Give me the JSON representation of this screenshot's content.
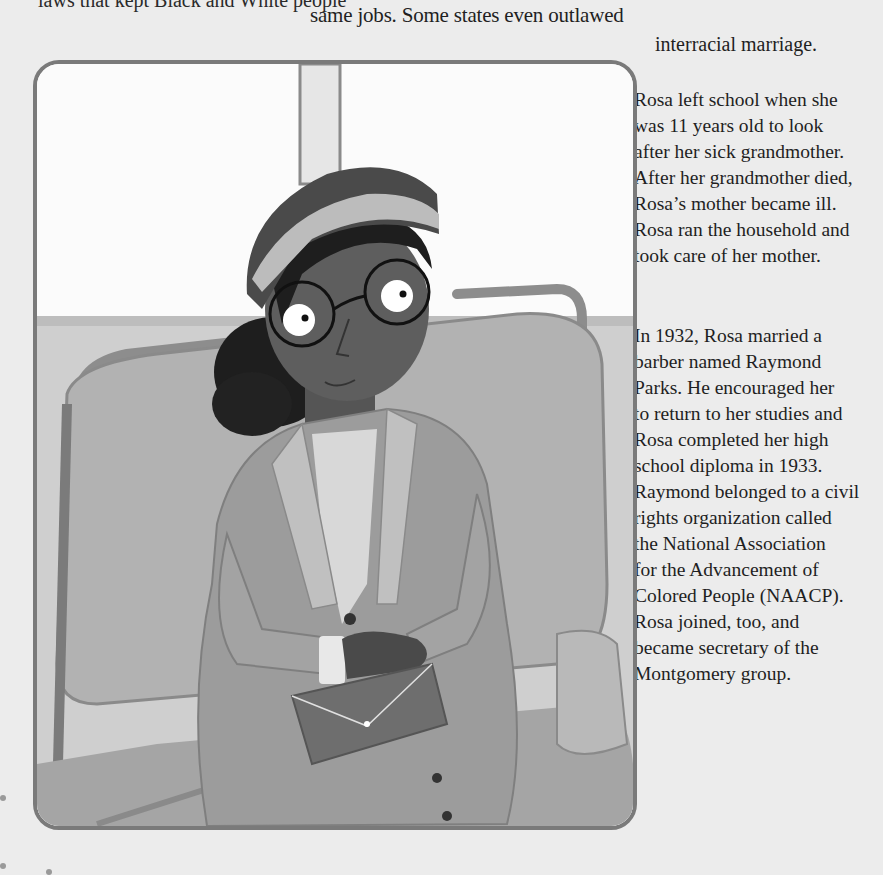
{
  "page": {
    "top_clipped_line": "laws that kept Black and White people",
    "top_right_lines": [
      "same jobs. Some states even outlawed",
      "interracial marriage."
    ],
    "paragraph_1": [
      "Rosa left school when she",
      "was 11 years old to look",
      "after her sick grandmother.",
      "After her grandmother died,",
      "Rosa’s mother became ill.",
      "Rosa ran the household and",
      "took care of her mother."
    ],
    "paragraph_2": [
      "In 1932, Rosa married a",
      "barber named Raymond",
      "Parks. He encouraged her",
      "to return to her studies and",
      "Rosa completed her high",
      "school diploma in 1933.",
      "Raymond belonged to a civil",
      "rights organization called",
      "the National Association",
      "for the Advancement of",
      "Colored People (NAACP).",
      "Rosa joined, too, and",
      "became secretary of the",
      "Montgomery group."
    ]
  },
  "illustration": {
    "subject": "Rosa Parks seated on a bus seat, wearing a hat and glasses, holding a purse on her lap",
    "frame_color": "#7a7a7a",
    "window_color": "#fbfbfb",
    "seat_color": "#a9a9a9",
    "skin_color": "#5e5e5e",
    "hair_color": "#1e1e1e",
    "coat_color": "#9c9c9c"
  }
}
